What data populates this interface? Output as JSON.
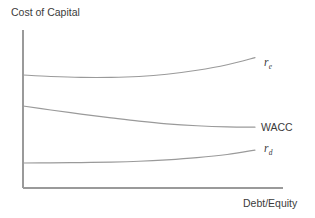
{
  "chart_data": {
    "type": "line",
    "title": "",
    "xlabel": "Debt/Equity",
    "ylabel": "Cost of Capital",
    "grid": false,
    "legend_position": "right-inline-labels",
    "axis_style": "open-left-bottom-no-ticks",
    "xlim": [
      0,
      1
    ],
    "ylim": [
      0,
      1
    ],
    "x_tick_labels": [],
    "y_tick_labels": [],
    "annotations": [
      "r_e rises with leverage (financial risk to equity holders)",
      "WACC declines then flattens",
      "r_d flat at low leverage then rises"
    ],
    "series": [
      {
        "name": "r_e",
        "label_main": "r",
        "label_sub": "e",
        "description": "Cost of equity",
        "color": "#9a9a9a",
        "x": [
          0.0,
          0.12,
          0.25,
          0.38,
          0.5,
          0.62,
          0.75,
          0.88,
          1.0
        ],
        "values": [
          0.715,
          0.706,
          0.7,
          0.7,
          0.706,
          0.72,
          0.745,
          0.78,
          0.825
        ]
      },
      {
        "name": "WACC",
        "label_main": "WACC",
        "label_sub": "",
        "description": "Weighted average cost of capital",
        "color": "#9a9a9a",
        "x": [
          0.0,
          0.12,
          0.25,
          0.38,
          0.5,
          0.62,
          0.75,
          0.88,
          1.0
        ],
        "values": [
          0.519,
          0.494,
          0.468,
          0.444,
          0.423,
          0.406,
          0.394,
          0.387,
          0.385
        ]
      },
      {
        "name": "r_d",
        "label_main": "r",
        "label_sub": "d",
        "description": "Cost of debt",
        "color": "#9a9a9a",
        "x": [
          0.0,
          0.12,
          0.25,
          0.38,
          0.5,
          0.62,
          0.75,
          0.88,
          1.0
        ],
        "values": [
          0.158,
          0.159,
          0.161,
          0.164,
          0.169,
          0.178,
          0.192,
          0.212,
          0.24
        ]
      }
    ]
  },
  "axes": {
    "y_title": "Cost of Capital",
    "x_title": "Debt/Equity"
  },
  "labels": {
    "re_main": "r",
    "re_sub": "e",
    "wacc": "WACC",
    "rd_main": "r",
    "rd_sub": "d"
  },
  "colors": {
    "line": "#9a9a9a",
    "axis": "#9a9a9a",
    "text": "#3b3b3b",
    "background": "#ffffff"
  }
}
